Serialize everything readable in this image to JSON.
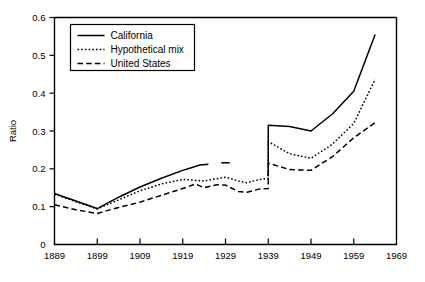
{
  "chart_data": {
    "type": "line",
    "title": "",
    "xlabel": "",
    "ylabel": "Ratio",
    "xlim": [
      1889,
      1969
    ],
    "ylim": [
      0,
      0.6
    ],
    "grid": false,
    "legend_position": "top-left-inside",
    "xticks": [
      1889,
      1899,
      1909,
      1919,
      1929,
      1939,
      1949,
      1959,
      1969
    ],
    "yticks": [
      "0",
      "0.1",
      "0.2",
      "0.3",
      "0.4",
      "0.5",
      "0.6"
    ],
    "ytick_values": [
      0,
      0.1,
      0.2,
      0.3,
      0.4,
      0.5,
      0.6
    ],
    "series": [
      {
        "name": "California",
        "style": "solid",
        "color": "#000000",
        "segments": [
          {
            "x": [
              1889,
              1894,
              1899,
              1904,
              1909,
              1914,
              1919,
              1921,
              1923,
              1925
            ],
            "y": [
              0.135,
              0.115,
              0.095,
              0.125,
              0.152,
              0.175,
              0.196,
              0.203,
              0.21,
              0.212
            ]
          },
          {
            "x": [
              1928,
              1930
            ],
            "y": [
              0.216,
              0.216
            ]
          },
          {
            "x": [
              1939,
              1939,
              1944,
              1949,
              1954,
              1959,
              1964
            ],
            "y": [
              0.18,
              0.315,
              0.312,
              0.3,
              0.345,
              0.405,
              0.555
            ]
          }
        ]
      },
      {
        "name": "Hypothetical mix",
        "style": "dotted",
        "color": "#000000",
        "segments": [
          {
            "x": [
              1889,
              1894,
              1899,
              1904,
              1909,
              1914,
              1919,
              1924,
              1929,
              1932,
              1934,
              1937,
              1939,
              1939,
              1944,
              1949,
              1954,
              1959,
              1964
            ],
            "y": [
              0.133,
              0.113,
              0.094,
              0.118,
              0.142,
              0.16,
              0.172,
              0.168,
              0.178,
              0.168,
              0.163,
              0.172,
              0.175,
              0.272,
              0.24,
              0.228,
              0.265,
              0.32,
              0.437
            ]
          }
        ]
      },
      {
        "name": "United States",
        "style": "dashed",
        "color": "#000000",
        "segments": [
          {
            "x": [
              1889,
              1894,
              1899,
              1904,
              1909,
              1914,
              1919,
              1922,
              1924,
              1927,
              1929,
              1932,
              1934,
              1937,
              1939,
              1939,
              1944,
              1949,
              1954,
              1959,
              1964
            ],
            "y": [
              0.105,
              0.092,
              0.082,
              0.098,
              0.112,
              0.13,
              0.148,
              0.16,
              0.15,
              0.158,
              0.157,
              0.14,
              0.138,
              0.147,
              0.148,
              0.215,
              0.198,
              0.196,
              0.232,
              0.282,
              0.322
            ]
          }
        ]
      }
    ]
  },
  "legend": {
    "items": [
      {
        "label": "California",
        "style": "solid"
      },
      {
        "label": "Hypothetical mix",
        "style": "dotted"
      },
      {
        "label": "United States",
        "style": "dashed"
      }
    ]
  }
}
